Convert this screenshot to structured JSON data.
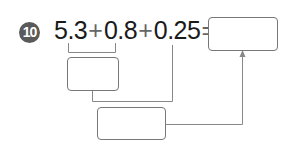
{
  "problem": {
    "number": "10",
    "terms": [
      "5.3",
      "0.8",
      "0.25"
    ],
    "operators": [
      "+",
      "+"
    ],
    "equals": "="
  },
  "boxes": {
    "answer": "",
    "step_1": "",
    "step_2": ""
  },
  "colors": {
    "badge": "#5a5a5a",
    "text": "#1a1a1a",
    "lines": "#888888"
  }
}
